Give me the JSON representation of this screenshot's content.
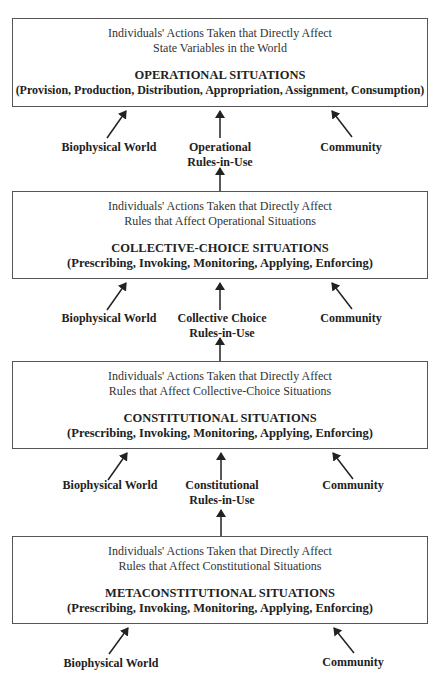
{
  "levels": [
    {
      "desc_line1": "Individuals' Actions Taken that Directly Affect",
      "desc_line2": "State Variables in the World",
      "title": "OPERATIONAL SITUATIONS",
      "activities": "(Provision, Production, Distribution, Appropriation, Assignment, Consumption)"
    },
    {
      "desc_line1": "Individuals' Actions Taken that Directly Affect",
      "desc_line2": "Rules that Affect Operational Situations",
      "title": "COLLECTIVE-CHOICE SITUATIONS",
      "activities": "(Prescribing, Invoking, Monitoring, Applying, Enforcing)"
    },
    {
      "desc_line1": "Individuals' Actions Taken that Directly Affect",
      "desc_line2": "Rules that Affect Collective-Choice Situations",
      "title": "CONSTITUTIONAL SITUATIONS",
      "activities": "(Prescribing, Invoking, Monitoring, Applying, Enforcing)"
    },
    {
      "desc_line1": "Individuals' Actions Taken that Directly Affect",
      "desc_line2": "Rules that Affect Constitutional Situations",
      "title": "METACONSTITUTIONAL SITUATIONS",
      "activities": "(Prescribing, Invoking, Monitoring, Applying, Enforcing)"
    }
  ],
  "inputs": [
    {
      "left": "Biophysical World",
      "center_line1": "Operational",
      "center_line2": "Rules-in-Use",
      "right": "Community"
    },
    {
      "left": "Biophysical World",
      "center_line1": "Collective Choice",
      "center_line2": "Rules-in-Use",
      "right": "Community"
    },
    {
      "left": "Biophysical World",
      "center_line1": "Constitutional",
      "center_line2": "Rules-in-Use",
      "right": "Community"
    },
    {
      "left": "Biophysical World",
      "right": "Community"
    }
  ]
}
